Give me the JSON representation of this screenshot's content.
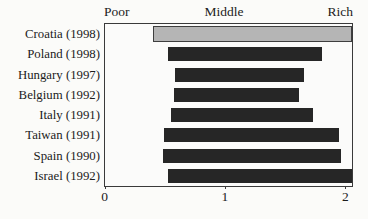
{
  "figure": {
    "header": {
      "left": "Poor",
      "center": "Middle",
      "right": "Rich"
    },
    "colors": {
      "bar": "#262626",
      "highlight_fill": "#b5b5b5",
      "highlight_border": "#3e3e3e",
      "frame": "#3a3a3a",
      "background": "#fbfbf9",
      "text": "#1c1c1c"
    }
  },
  "chart_data": {
    "type": "bar",
    "orientation": "horizontal",
    "subtype": "floating-range-bars",
    "title": "",
    "xlabel": "",
    "ylabel": "",
    "xlim": [
      0,
      2.05
    ],
    "x_ticks": [
      0,
      1,
      2
    ],
    "x_tick_labels": [
      "0",
      "1",
      "2"
    ],
    "top_axis_labels": [
      "Poor",
      "Middle",
      "Rich"
    ],
    "grid": false,
    "legend": "none",
    "categories": [
      "Croatia (1998)",
      "Poland (1998)",
      "Hungary (1997)",
      "Belgium (1992)",
      "Italy (1991)",
      "Taiwan (1991)",
      "Spain (1990)",
      "Israel (1992)"
    ],
    "ranges": [
      {
        "label": "Croatia (1998)",
        "start": 0.4,
        "end": 2.05,
        "highlight": true
      },
      {
        "label": "Poland (1998)",
        "start": 0.52,
        "end": 1.8,
        "highlight": false
      },
      {
        "label": "Hungary (1997)",
        "start": 0.58,
        "end": 1.65,
        "highlight": false
      },
      {
        "label": "Belgium (1992)",
        "start": 0.57,
        "end": 1.61,
        "highlight": false
      },
      {
        "label": "Italy (1991)",
        "start": 0.55,
        "end": 1.73,
        "highlight": false
      },
      {
        "label": "Taiwan (1991)",
        "start": 0.49,
        "end": 1.94,
        "highlight": false
      },
      {
        "label": "Spain (1990)",
        "start": 0.48,
        "end": 1.96,
        "highlight": false
      },
      {
        "label": "Israel (1992)",
        "start": 0.52,
        "end": 2.05,
        "highlight": false
      }
    ]
  }
}
